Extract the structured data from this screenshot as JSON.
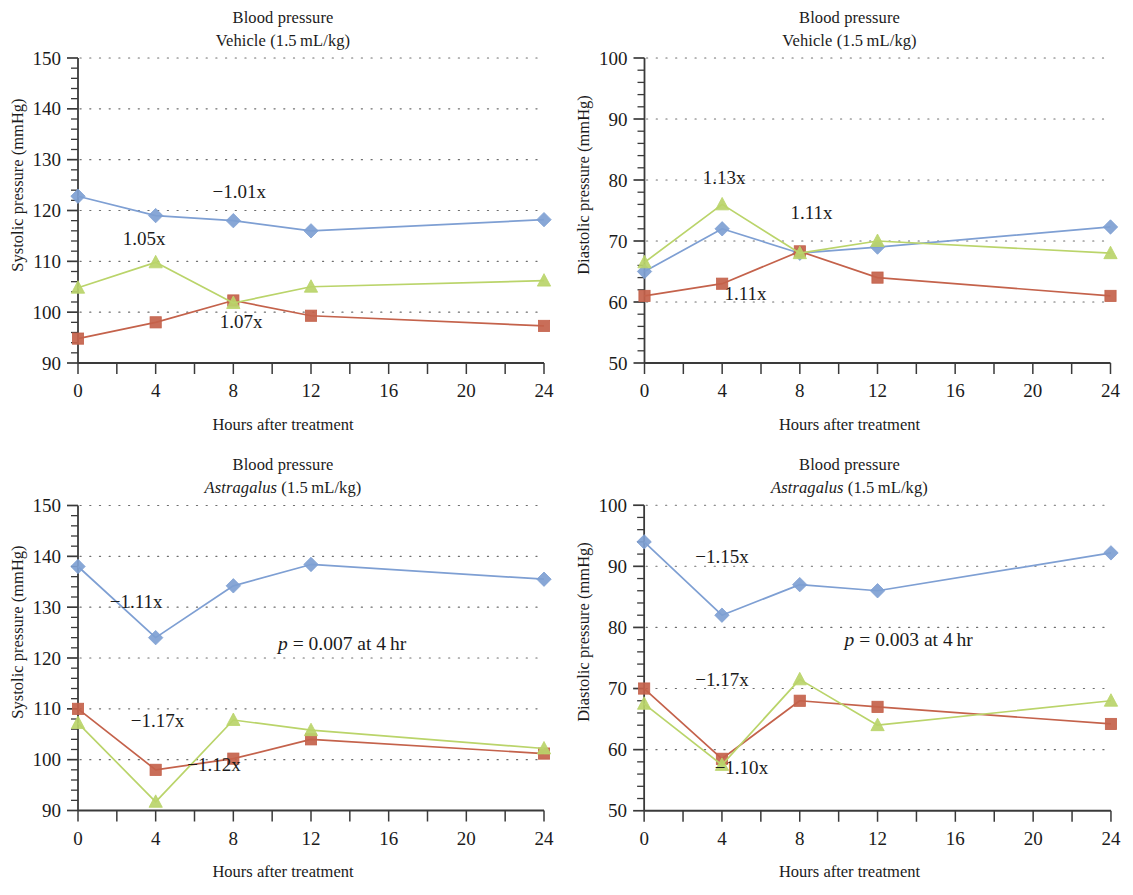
{
  "figure": {
    "panel_count": 4,
    "colors": {
      "series1": "#7e9fd3",
      "series2": "#c4624b",
      "series3": "#bad46a",
      "axis": "#3a3a3a",
      "grid": "#6e6e6e",
      "text": "#1b1b1b"
    }
  },
  "panels": [
    {
      "id": "top-left",
      "title_line1": "Blood pressure",
      "title_line2_prefix": "Vehicle",
      "title_line2_species": "",
      "title_line2_suffix": " (1.5 mL/kg)",
      "xlabel": "Hours after treatment",
      "ylabel": "Systolic pressure (mmHg)",
      "pvalue": "",
      "annotations": [
        {
          "text": "−1.01x",
          "x": 8.3,
          "y": 122.5
        },
        {
          "text": "1.05x",
          "x": 3.4,
          "y": 113.3
        },
        {
          "text": "1.07x",
          "x": 8.4,
          "y": 96.8
        }
      ]
    },
    {
      "id": "top-right",
      "title_line1": "Blood pressure",
      "title_line2_prefix": "Vehicle",
      "title_line2_species": "",
      "title_line2_suffix": " (1.5 mL/kg)",
      "xlabel": "Hours after treatment",
      "ylabel": "Diastolic pressure (mmHg)",
      "pvalue": "",
      "annotations": [
        {
          "text": "1.13x",
          "x": 4.1,
          "y": 79.3
        },
        {
          "text": "1.11x",
          "x": 8.6,
          "y": 73.6
        },
        {
          "text": "1.11x",
          "x": 5.2,
          "y": 60.3
        }
      ]
    },
    {
      "id": "bottom-left",
      "title_line1": "Blood pressure",
      "title_line2_prefix": "",
      "title_line2_species": "Astragalus",
      "title_line2_suffix": " (1.5 mL/kg)",
      "xlabel": "Hours after treatment",
      "ylabel": "Systolic pressure (mmHg)",
      "pvalue": "= 0.007 at 4 hr",
      "annotations": [
        {
          "text": "−1.11x",
          "x": 3.0,
          "y": 129.8
        },
        {
          "text": "−1.17x",
          "x": 4.1,
          "y": 106.4
        },
        {
          "text": "−1.12x",
          "x": 7.0,
          "y": 97.8
        }
      ]
    },
    {
      "id": "bottom-right",
      "title_line1": "Blood pressure",
      "title_line2_prefix": "",
      "title_line2_species": "Astragalus",
      "title_line2_suffix": " (1.5 mL/kg)",
      "xlabel": "Hours after treatment",
      "ylabel": "Diastolic pressure (mmHg)",
      "pvalue": "= 0.003 at 4 hr",
      "annotations": [
        {
          "text": "−1.15x",
          "x": 4.0,
          "y": 90.5
        },
        {
          "text": "−1.17x",
          "x": 4.0,
          "y": 70.4
        },
        {
          "text": "−1.10x",
          "x": 5.0,
          "y": 56.0
        }
      ]
    }
  ],
  "pvalue_symbol": "p",
  "chart_data": [
    {
      "type": "line",
      "panel": "top-left",
      "title": "Blood pressure Vehicle (1.5 mL/kg)",
      "xlabel": "Hours after treatment",
      "ylabel": "Systolic pressure (mmHg)",
      "x": [
        0,
        4,
        8,
        12,
        24
      ],
      "xticks": [
        0,
        4,
        8,
        12,
        16,
        20,
        24
      ],
      "xlim": [
        0,
        24
      ],
      "ylim": [
        90,
        150
      ],
      "yticks": [
        90,
        100,
        110,
        120,
        130,
        140,
        150
      ],
      "y_minor_step": 2,
      "grid": "dotted-horizontal",
      "legend": "none",
      "series": [
        {
          "name": "series1",
          "marker": "diamond",
          "color": "#7e9fd3",
          "values": [
            122.8,
            119.0,
            118.0,
            116.0,
            118.2
          ]
        },
        {
          "name": "series2",
          "marker": "square",
          "color": "#c4624b",
          "values": [
            94.8,
            98.0,
            102.3,
            99.3,
            97.3
          ]
        },
        {
          "name": "series3",
          "marker": "triangle",
          "color": "#bad46a",
          "values": [
            104.8,
            109.8,
            101.8,
            105.0,
            106.2
          ]
        }
      ]
    },
    {
      "type": "line",
      "panel": "top-right",
      "title": "Blood pressure Vehicle (1.5 mL/kg)",
      "xlabel": "Hours after treatment",
      "ylabel": "Diastolic pressure (mmHg)",
      "x": [
        0,
        4,
        8,
        12,
        24
      ],
      "xticks": [
        0,
        4,
        8,
        12,
        16,
        20,
        24
      ],
      "xlim": [
        0,
        24
      ],
      "ylim": [
        50,
        100
      ],
      "yticks": [
        50,
        60,
        70,
        80,
        90,
        100
      ],
      "y_minor_step": 2,
      "grid": "dotted-horizontal",
      "legend": "none",
      "series": [
        {
          "name": "series1",
          "marker": "diamond",
          "color": "#7e9fd3",
          "values": [
            65.0,
            72.0,
            68.0,
            69.0,
            72.3
          ]
        },
        {
          "name": "series2",
          "marker": "square",
          "color": "#c4624b",
          "values": [
            61.0,
            63.0,
            68.3,
            64.0,
            61.0
          ]
        },
        {
          "name": "series3",
          "marker": "triangle",
          "color": "#bad46a",
          "values": [
            66.5,
            76.0,
            68.0,
            70.0,
            68.0
          ]
        }
      ]
    },
    {
      "type": "line",
      "panel": "bottom-left",
      "title": "Blood pressure Astragalus (1.5 mL/kg)",
      "xlabel": "Hours after treatment",
      "ylabel": "Systolic pressure (mmHg)",
      "x": [
        0,
        4,
        8,
        12,
        24
      ],
      "xticks": [
        0,
        4,
        8,
        12,
        16,
        20,
        24
      ],
      "xlim": [
        0,
        24
      ],
      "ylim": [
        90,
        150
      ],
      "yticks": [
        90,
        100,
        110,
        120,
        130,
        140,
        150
      ],
      "y_minor_step": 2,
      "grid": "dotted-horizontal",
      "legend": "none",
      "annotation_p": "p = 0.007 at 4 hr",
      "series": [
        {
          "name": "series1",
          "marker": "diamond",
          "color": "#7e9fd3",
          "values": [
            138.0,
            124.0,
            134.2,
            138.4,
            135.5
          ]
        },
        {
          "name": "series2",
          "marker": "square",
          "color": "#c4624b",
          "values": [
            110.0,
            98.0,
            100.2,
            104.0,
            101.2
          ]
        },
        {
          "name": "series3",
          "marker": "triangle",
          "color": "#bad46a",
          "values": [
            107.2,
            91.7,
            107.8,
            105.8,
            102.2
          ]
        }
      ]
    },
    {
      "type": "line",
      "panel": "bottom-right",
      "title": "Blood pressure Astragalus (1.5 mL/kg)",
      "xlabel": "Hours after treatment",
      "ylabel": "Diastolic pressure (mmHg)",
      "x": [
        0,
        4,
        8,
        12,
        24
      ],
      "xticks": [
        0,
        4,
        8,
        12,
        16,
        20,
        24
      ],
      "xlim": [
        50,
        100
      ],
      "ylim": [
        50,
        100
      ],
      "yticks": [
        50,
        60,
        70,
        80,
        90,
        100
      ],
      "y_minor_step": 2,
      "grid": "dotted-horizontal",
      "legend": "none",
      "annotation_p": "p = 0.003 at 4 hr",
      "series": [
        {
          "name": "series1",
          "marker": "diamond",
          "color": "#7e9fd3",
          "values": [
            94.0,
            82.0,
            87.0,
            86.0,
            92.2
          ]
        },
        {
          "name": "series2",
          "marker": "square",
          "color": "#c4624b",
          "values": [
            70.0,
            58.5,
            68.0,
            67.0,
            64.2
          ]
        },
        {
          "name": "series3",
          "marker": "triangle",
          "color": "#bad46a",
          "values": [
            67.5,
            57.5,
            71.5,
            64.0,
            68.0
          ]
        }
      ]
    }
  ]
}
